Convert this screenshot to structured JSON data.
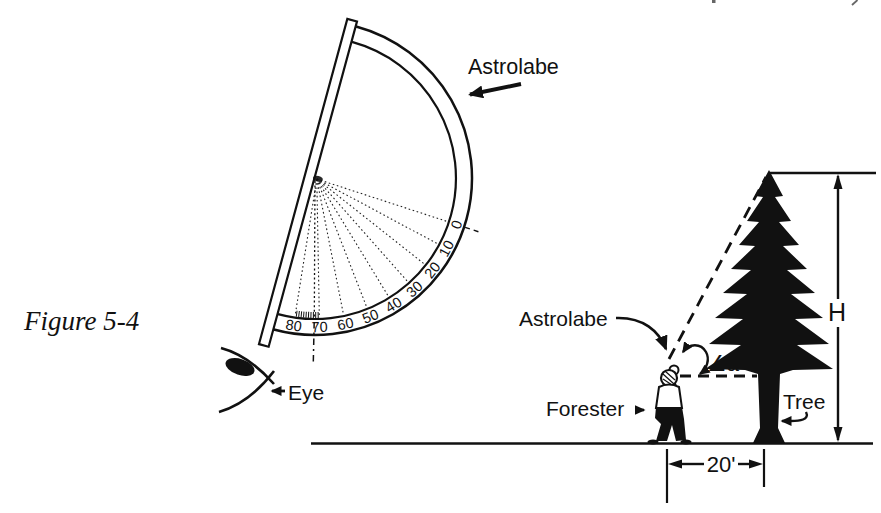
{
  "figure": {
    "caption": "Figure 5-4"
  },
  "left_scene": {
    "astrolabe_label": "Astrolabe",
    "eye_label": "Eye",
    "scale_labels": [
      "80",
      "70",
      "60",
      "50",
      "40",
      "30",
      "20",
      "10",
      "0"
    ]
  },
  "right_scene": {
    "astrolabe_label": "Astrolabe",
    "forester_label": "Forester",
    "tree_label": "Tree",
    "angle_label": "∠a",
    "height_label": "H",
    "distance_label": "20'"
  },
  "colors": {
    "ink": "#111111",
    "background": "#ffffff"
  }
}
